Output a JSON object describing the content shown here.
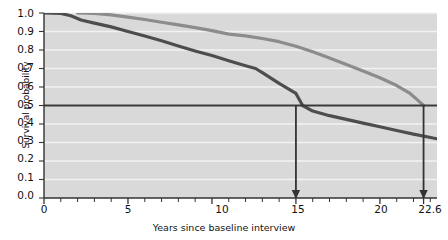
{
  "chart_data": {
    "type": "line",
    "title": "",
    "xlabel": "Years since baseline interview",
    "ylabel": "Survival probability",
    "xlim": [
      0,
      23.4
    ],
    "ylim": [
      0.0,
      1.0
    ],
    "grid": true,
    "grid_orientation": "horizontal",
    "legend": "inline-annotations",
    "background": "#d9d9d9",
    "xticks_major": [
      "0",
      "5",
      "10",
      "15",
      "20",
      "22.6"
    ],
    "xticks_major_values": [
      0,
      5,
      10,
      15,
      20,
      22.6
    ],
    "xticks_minor_step": 1,
    "yticks": [
      "0.0",
      "0.1",
      "0.2",
      "0.3",
      "0.4",
      "0.5",
      "0.6",
      "0.7",
      "0.8",
      "0.9",
      "1.0"
    ],
    "ytick_values": [
      0.0,
      0.1,
      0.2,
      0.3,
      0.4,
      0.5,
      0.6,
      0.7,
      0.8,
      0.9,
      1.0
    ],
    "series": [
      {
        "name": "Positive attitudes",
        "color": "#8c8c8c",
        "label_text": "Positive attitudes",
        "points": [
          [
            2.0,
            1.0
          ],
          [
            3.0,
            0.998
          ],
          [
            4.0,
            0.99
          ],
          [
            5.0,
            0.978
          ],
          [
            6.0,
            0.965
          ],
          [
            7.0,
            0.95
          ],
          [
            8.0,
            0.936
          ],
          [
            9.0,
            0.921
          ],
          [
            10.0,
            0.905
          ],
          [
            11.0,
            0.886
          ],
          [
            12.0,
            0.876
          ],
          [
            13.0,
            0.862
          ],
          [
            14.0,
            0.845
          ],
          [
            15.0,
            0.82
          ],
          [
            16.0,
            0.79
          ],
          [
            17.0,
            0.757
          ],
          [
            18.0,
            0.722
          ],
          [
            19.0,
            0.686
          ],
          [
            20.0,
            0.65
          ],
          [
            21.0,
            0.608
          ],
          [
            21.8,
            0.565
          ],
          [
            22.3,
            0.525
          ],
          [
            22.6,
            0.5
          ]
        ]
      },
      {
        "name": "Negative attitudes",
        "color": "#4d4d4d",
        "label_text": "Negative attitudes",
        "points": [
          [
            0.0,
            1.0
          ],
          [
            1.0,
            0.998
          ],
          [
            1.6,
            0.985
          ],
          [
            2.2,
            0.962
          ],
          [
            3.0,
            0.945
          ],
          [
            4.0,
            0.925
          ],
          [
            5.0,
            0.9
          ],
          [
            6.0,
            0.876
          ],
          [
            7.0,
            0.85
          ],
          [
            8.0,
            0.822
          ],
          [
            9.0,
            0.795
          ],
          [
            10.0,
            0.77
          ],
          [
            11.0,
            0.742
          ],
          [
            12.0,
            0.715
          ],
          [
            12.6,
            0.7
          ],
          [
            13.0,
            0.678
          ],
          [
            14.0,
            0.62
          ],
          [
            15.0,
            0.565
          ],
          [
            15.4,
            0.5
          ],
          [
            16.0,
            0.47
          ],
          [
            17.0,
            0.445
          ],
          [
            18.0,
            0.425
          ],
          [
            19.0,
            0.405
          ],
          [
            20.0,
            0.385
          ],
          [
            21.0,
            0.365
          ],
          [
            22.0,
            0.345
          ],
          [
            23.4,
            0.32
          ]
        ]
      },
      {
        "name": "Average",
        "color": "#3a3a3a",
        "label_text": "Average",
        "constant_value": 0.5,
        "style": "horizontal-reference-line"
      }
    ],
    "annotations": [
      {
        "name": "average-negative-group",
        "text_line1": "Average for",
        "text_line2": "negative group",
        "arrow_x": 15,
        "arrow_from_y": 0.5,
        "arrow_to_y": 0.0
      },
      {
        "name": "average-positive-group",
        "text_line1": "Average for",
        "text_line2": "positive group",
        "arrow_x": 22.6,
        "arrow_from_y": 0.5,
        "arrow_to_y": 0.0
      }
    ]
  },
  "axes": {
    "ylabel": "Survival probability",
    "xlabel": "Years since baseline interview",
    "ytick_labels": [
      "1.0",
      "0.9",
      "0.8",
      "0.7",
      "0.6",
      "0.5",
      "0.4",
      "0.3",
      "0.2",
      "0.1",
      "0.0"
    ],
    "xtick_labels": [
      "0",
      "5",
      "10",
      "15",
      "20",
      "22.6"
    ]
  },
  "labels": {
    "positive": "Positive attitudes",
    "negative": "Negative attitudes",
    "average": "Average",
    "ann_neg_l1": "Average for",
    "ann_neg_l2": "negative group",
    "ann_pos_l1": "Average for",
    "ann_pos_l2": "positive group"
  },
  "colors": {
    "plot_bg": "#d9d9d9",
    "grid": "#f2f2f2",
    "positive_line": "#8c8c8c",
    "negative_line": "#4d4d4d",
    "average_line": "#3a3a3a",
    "axis": "#333333",
    "text": "#111111"
  }
}
